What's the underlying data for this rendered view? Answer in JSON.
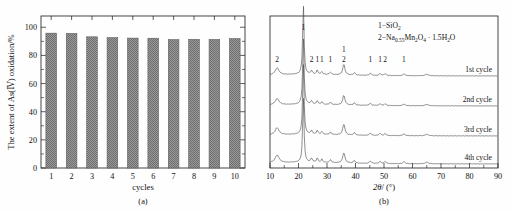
{
  "figure": {
    "panels": [
      {
        "caption": "(a)",
        "kind": "bar-chart"
      },
      {
        "caption": "(b)",
        "kind": "xrd-line-chart"
      }
    ]
  },
  "panel_a": {
    "caption": "(a)",
    "ylabel_prefix": "The extent of As(",
    "ylabel_roman": "III",
    "ylabel_suffix": ") oxidation/%",
    "ylabel_full": "The extent of As(III) oxidation/%",
    "xlabel": "cycles",
    "ytick_labels": [
      "0",
      "20",
      "40",
      "60",
      "80",
      "100"
    ],
    "xtick_labels": [
      "1",
      "2",
      "3",
      "4",
      "5",
      "6",
      "7",
      "8",
      "9",
      "10"
    ],
    "bar_color": "#8c8c8c",
    "bar_edge_color": "#5d5d5d"
  },
  "panel_b": {
    "caption": "(b)",
    "xlabel_theta": "2θ",
    "xlabel_rest": "/ (°)",
    "xlabel_full": "2θ/ (°)",
    "xtick_labels": [
      "10",
      "20",
      "30",
      "40",
      "50",
      "60",
      "70",
      "80",
      "90"
    ],
    "legend": [
      {
        "index": "1",
        "dash": "−",
        "formula_html": "SiO<sub>2</sub>",
        "formula_text": "1−SiO2"
      },
      {
        "index": "2",
        "dash": "−",
        "formula_html": "Na<sub>0.55</sub>Mn<sub>2</sub>O<sub>4</sub> · 1.5H<sub>2</sub>O",
        "formula_text": "2−Na0.55Mn2O4 · 1.5H2O"
      }
    ],
    "curve_labels": [
      "1st cycle",
      "2nd cycle",
      "3rd cycle",
      "4th cycle"
    ],
    "peak_annotations": [
      {
        "label": "2",
        "two_theta": 12.5,
        "row": "low"
      },
      {
        "label": "1",
        "two_theta": 21.7,
        "row": "top"
      },
      {
        "label": "2",
        "two_theta": 24.6,
        "row": "low"
      },
      {
        "label": "1",
        "two_theta": 26.6,
        "row": "low"
      },
      {
        "label": "1",
        "two_theta": 28.2,
        "row": "low"
      },
      {
        "label": "1",
        "two_theta": 31.2,
        "row": "low"
      },
      {
        "label": "1",
        "two_theta": 35.9,
        "row": "mid"
      },
      {
        "label": "2",
        "two_theta": 35.9,
        "row": "low"
      },
      {
        "label": "1",
        "two_theta": 45.2,
        "row": "low"
      },
      {
        "label": "1",
        "two_theta": 48.6,
        "row": "low"
      },
      {
        "label": "2",
        "two_theta": 50.4,
        "row": "low"
      },
      {
        "label": "1",
        "two_theta": 57.0,
        "row": "low"
      }
    ],
    "trace_color": "#4a4a4a"
  },
  "chart_data": [
    {
      "type": "bar",
      "panel": "(a)",
      "title": "",
      "xlabel": "cycles",
      "ylabel": "The extent of As(III) oxidation/%",
      "categories": [
        "1",
        "2",
        "3",
        "4",
        "5",
        "6",
        "7",
        "8",
        "9",
        "10"
      ],
      "values": [
        95.8,
        95.6,
        93.2,
        92.6,
        92.3,
        92.2,
        91.2,
        91.4,
        91.3,
        91.9
      ],
      "ylim": [
        0,
        108
      ],
      "yticks": [
        0,
        20,
        40,
        60,
        80,
        100
      ],
      "grid": false,
      "legend": "none",
      "bar_fill": "checkered-gray"
    },
    {
      "type": "line",
      "panel": "(b)",
      "title": "",
      "xlabel": "2θ/ (°)",
      "ylabel": "",
      "xlim": [
        10,
        90
      ],
      "xticks": [
        10,
        20,
        30,
        40,
        50,
        60,
        70,
        80,
        90
      ],
      "grid": false,
      "legend_position": "top-right",
      "legend_entries": [
        "1−SiO2",
        "2−Na0.55Mn2O4 · 1.5H2O"
      ],
      "series": [
        {
          "name": "1st cycle",
          "offset_index": 0,
          "peaks": [
            {
              "x": 12.5,
              "height": 4.5,
              "width": 1.6
            },
            {
              "x": 21.7,
              "height": 46.0,
              "width": 0.55
            },
            {
              "x": 24.6,
              "height": 2.2,
              "width": 0.7
            },
            {
              "x": 26.6,
              "height": 2.6,
              "width": 0.6
            },
            {
              "x": 28.2,
              "height": 1.8,
              "width": 0.6
            },
            {
              "x": 31.2,
              "height": 1.6,
              "width": 0.7
            },
            {
              "x": 35.9,
              "height": 7.0,
              "width": 0.9
            },
            {
              "x": 39.6,
              "height": 1.6,
              "width": 0.7
            },
            {
              "x": 45.2,
              "height": 1.4,
              "width": 0.8
            },
            {
              "x": 48.6,
              "height": 1.3,
              "width": 0.7
            },
            {
              "x": 50.4,
              "height": 1.3,
              "width": 0.7
            },
            {
              "x": 57.0,
              "height": 1.2,
              "width": 0.8
            },
            {
              "x": 65.0,
              "height": 1.0,
              "width": 1.2
            }
          ]
        },
        {
          "name": "2nd cycle",
          "offset_index": 1,
          "peaks": [
            {
              "x": 12.5,
              "height": 4.0,
              "width": 1.6
            },
            {
              "x": 21.7,
              "height": 44.0,
              "width": 0.55
            },
            {
              "x": 24.6,
              "height": 2.0,
              "width": 0.7
            },
            {
              "x": 26.6,
              "height": 2.4,
              "width": 0.6
            },
            {
              "x": 28.2,
              "height": 1.6,
              "width": 0.6
            },
            {
              "x": 31.2,
              "height": 1.5,
              "width": 0.7
            },
            {
              "x": 35.9,
              "height": 6.4,
              "width": 0.9
            },
            {
              "x": 39.6,
              "height": 1.5,
              "width": 0.7
            },
            {
              "x": 45.2,
              "height": 1.3,
              "width": 0.8
            },
            {
              "x": 48.6,
              "height": 1.2,
              "width": 0.7
            },
            {
              "x": 50.4,
              "height": 1.2,
              "width": 0.7
            },
            {
              "x": 57.0,
              "height": 1.1,
              "width": 0.8
            },
            {
              "x": 65.0,
              "height": 0.9,
              "width": 1.2
            }
          ]
        },
        {
          "name": "3rd cycle",
          "offset_index": 2,
          "peaks": [
            {
              "x": 12.5,
              "height": 4.6,
              "width": 1.6
            },
            {
              "x": 21.7,
              "height": 47.0,
              "width": 0.55
            },
            {
              "x": 24.6,
              "height": 2.2,
              "width": 0.7
            },
            {
              "x": 26.6,
              "height": 2.6,
              "width": 0.6
            },
            {
              "x": 28.2,
              "height": 1.8,
              "width": 0.6
            },
            {
              "x": 31.2,
              "height": 1.6,
              "width": 0.7
            },
            {
              "x": 35.9,
              "height": 7.2,
              "width": 0.9
            },
            {
              "x": 39.6,
              "height": 1.6,
              "width": 0.7
            },
            {
              "x": 45.2,
              "height": 1.4,
              "width": 0.8
            },
            {
              "x": 48.6,
              "height": 1.3,
              "width": 0.7
            },
            {
              "x": 50.4,
              "height": 1.3,
              "width": 0.7
            },
            {
              "x": 57.0,
              "height": 1.2,
              "width": 0.8
            },
            {
              "x": 65.0,
              "height": 1.0,
              "width": 1.2
            }
          ]
        },
        {
          "name": "4th cycle",
          "offset_index": 3,
          "peaks": [
            {
              "x": 12.5,
              "height": 5.0,
              "width": 1.7
            },
            {
              "x": 21.7,
              "height": 43.0,
              "width": 0.55
            },
            {
              "x": 24.6,
              "height": 2.4,
              "width": 0.7
            },
            {
              "x": 26.6,
              "height": 2.8,
              "width": 0.6
            },
            {
              "x": 28.2,
              "height": 2.0,
              "width": 0.6
            },
            {
              "x": 31.2,
              "height": 1.8,
              "width": 0.7
            },
            {
              "x": 35.9,
              "height": 6.8,
              "width": 0.9
            },
            {
              "x": 39.6,
              "height": 1.7,
              "width": 0.7
            },
            {
              "x": 45.2,
              "height": 1.5,
              "width": 0.8
            },
            {
              "x": 48.6,
              "height": 1.4,
              "width": 0.7
            },
            {
              "x": 50.4,
              "height": 1.4,
              "width": 0.7
            },
            {
              "x": 57.0,
              "height": 1.3,
              "width": 0.8
            },
            {
              "x": 65.0,
              "height": 1.1,
              "width": 1.2
            }
          ]
        }
      ]
    }
  ]
}
